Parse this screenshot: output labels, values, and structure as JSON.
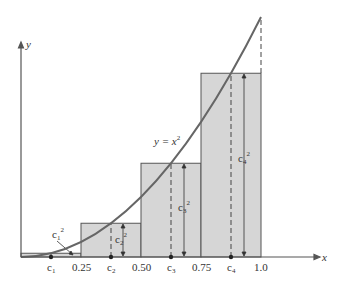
{
  "figure": {
    "curve_label": "y = x",
    "curve_exponent": "2",
    "axis_x_label": "x",
    "axis_y_label": "y",
    "ticks": [
      {
        "label": "0.25",
        "value": 0.25
      },
      {
        "label": "0.50",
        "value": 0.5
      },
      {
        "label": "0.75",
        "value": 0.75
      },
      {
        "label": "1.0",
        "value": 1.0
      }
    ],
    "midpoints": [
      {
        "label": "c",
        "sub": "1",
        "value": 0.125,
        "height_label": "c",
        "height_sub": "1",
        "height_sup": "2"
      },
      {
        "label": "c",
        "sub": "2",
        "value": 0.375,
        "height_label": "c",
        "height_sub": "2",
        "height_sup": "2"
      },
      {
        "label": "c",
        "sub": "3",
        "value": 0.625,
        "height_label": "c",
        "height_sub": "3",
        "height_sup": "2"
      },
      {
        "label": "c",
        "sub": "4",
        "value": 0.875,
        "height_label": "c",
        "height_sub": "4",
        "height_sup": "2"
      }
    ],
    "colors": {
      "rect_fill": "#d6d6d6",
      "stroke": "#555555",
      "curve": "#666666"
    }
  }
}
